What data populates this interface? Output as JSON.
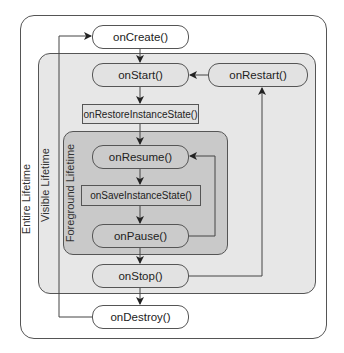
{
  "diagram": {
    "regions": {
      "entire": {
        "label": "Entire Lifetime"
      },
      "visible": {
        "label": "Visible Lifetime"
      },
      "foreground": {
        "label": "Foreground Lifetime"
      }
    },
    "nodes": {
      "on_create": "onCreate()",
      "on_start": "onStart()",
      "on_restart": "onRestart()",
      "on_restore_instance_state": "onRestoreInstanceState()",
      "on_resume": "onResume()",
      "on_save_instance_state": "onSaveInstanceState()",
      "on_pause": "onPause()",
      "on_stop": "onStop()",
      "on_destroy": "onDestroy()"
    },
    "edges": [
      {
        "from": "onCreate()",
        "to": "onStart()"
      },
      {
        "from": "onStart()",
        "to": "onRestoreInstanceState()"
      },
      {
        "from": "onRestoreInstanceState()",
        "to": "onResume()"
      },
      {
        "from": "onResume()",
        "to": "onSaveInstanceState()"
      },
      {
        "from": "onSaveInstanceState()",
        "to": "onPause()"
      },
      {
        "from": "onPause()",
        "to": "onResume()"
      },
      {
        "from": "onPause()",
        "to": "onStop()"
      },
      {
        "from": "onStop()",
        "to": "onRestart()"
      },
      {
        "from": "onRestart()",
        "to": "onStart()"
      },
      {
        "from": "onStop()",
        "to": "onDestroy()"
      },
      {
        "from": "onDestroy()",
        "to": "onCreate()"
      }
    ],
    "colors": {
      "entire_fill": "#ffffff",
      "visible_fill": "#e7e7e7",
      "foreground_fill": "#c9c9c9",
      "stroke": "#555555"
    }
  }
}
